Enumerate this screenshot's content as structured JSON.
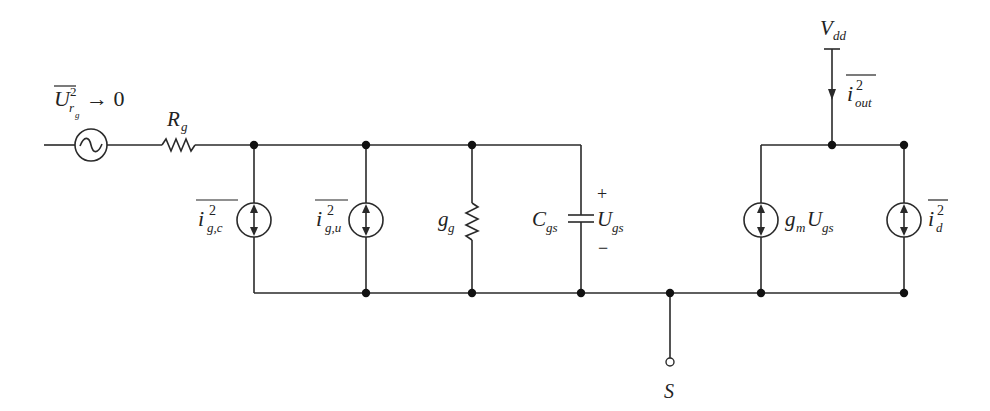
{
  "diagram": {
    "type": "small-signal noise equivalent circuit",
    "colors": {
      "line": "#2a2a2a",
      "node": "#111111",
      "text": "#222222",
      "background": "#ffffff"
    },
    "source_label": {
      "base": "U",
      "sup": "2",
      "sub": "r",
      "subsub": "g",
      "relation": "→ 0",
      "overbar": true
    },
    "resistor_rg": {
      "base": "R",
      "sub": "g"
    },
    "noise_source_gc": {
      "base": "i",
      "sup": "2",
      "sub": "g,c",
      "overbar": true
    },
    "noise_source_gu": {
      "base": "i",
      "sup": "2",
      "sub": "g,u",
      "overbar": true
    },
    "conductance_gg": {
      "base": "g",
      "sub": "g"
    },
    "capacitor_cgs": {
      "base": "C",
      "sub": "gs"
    },
    "voltage_ugs": {
      "base": "U",
      "sub": "gs",
      "plus": "+",
      "minus": "−"
    },
    "vdd": {
      "base": "V",
      "sub": "dd"
    },
    "output_current": {
      "base": "i",
      "sup": "2",
      "sub": "out",
      "overbar": true
    },
    "dependent_source": {
      "base": "g",
      "sub": "m",
      "base2": "U",
      "sub2": "gs"
    },
    "drain_noise": {
      "base": "i",
      "sup": "2",
      "sub": "d",
      "overbar": true
    },
    "source_terminal": {
      "label": "S"
    }
  }
}
